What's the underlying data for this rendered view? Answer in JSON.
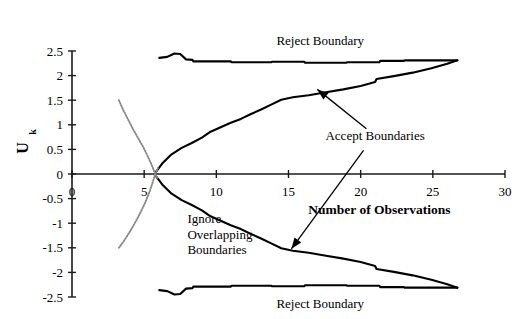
{
  "chart_data": {
    "type": "line",
    "title": "",
    "xlabel": "Number of Observations",
    "ylabel": "U",
    "ylabel_subscript": "k",
    "xlim": [
      0,
      30
    ],
    "ylim": [
      -2.5,
      2.5
    ],
    "xticks": [
      0,
      5,
      10,
      15,
      20,
      25,
      30
    ],
    "xtick_labels": [
      "0",
      "5",
      "10",
      "15",
      "20",
      "25",
      "30"
    ],
    "yticks": [
      -2.5,
      -2,
      -1.5,
      -1,
      -0.5,
      0,
      0.5,
      1,
      1.5,
      2,
      2.5
    ],
    "ytick_labels": [
      "-2.5",
      "-2",
      "-1.5",
      "-1",
      "-0.5",
      "0",
      "0.5",
      "1",
      "1.5",
      "2",
      "2.5"
    ],
    "grid": false,
    "legend_position": "none",
    "line_color": "#000000",
    "dotted_color": "#8a8a8a",
    "axis_color": "#1a1a1a",
    "series": [
      {
        "name": "Upper Reject Boundary",
        "style": "solid-step",
        "points": [
          [
            6.05,
            2.36
          ],
          [
            6.6,
            2.38
          ],
          [
            7.1,
            2.45
          ],
          [
            7.5,
            2.44
          ],
          [
            7.9,
            2.33
          ],
          [
            8.35,
            2.32
          ],
          [
            8.4,
            2.29
          ],
          [
            11.0,
            2.29
          ],
          [
            11.05,
            2.27
          ],
          [
            13.8,
            2.27
          ],
          [
            13.85,
            2.28
          ],
          [
            16.1,
            2.28
          ],
          [
            16.15,
            2.26
          ],
          [
            19.0,
            2.26
          ],
          [
            19.05,
            2.27
          ],
          [
            21.3,
            2.27
          ],
          [
            21.35,
            2.3
          ],
          [
            23.0,
            2.3
          ],
          [
            23.05,
            2.31
          ],
          [
            26.7,
            2.31
          ]
        ]
      },
      {
        "name": "Upper Accept Boundary",
        "style": "solid",
        "points": [
          [
            5.75,
            0.02
          ],
          [
            6.3,
            0.23
          ],
          [
            6.9,
            0.4
          ],
          [
            7.6,
            0.53
          ],
          [
            8.3,
            0.63
          ],
          [
            9.0,
            0.74
          ],
          [
            9.6,
            0.86
          ],
          [
            10.3,
            0.95
          ],
          [
            11.0,
            1.04
          ],
          [
            11.7,
            1.12
          ],
          [
            12.4,
            1.22
          ],
          [
            13.1,
            1.31
          ],
          [
            13.8,
            1.41
          ],
          [
            14.5,
            1.51
          ],
          [
            15.3,
            1.56
          ],
          [
            16.4,
            1.6
          ],
          [
            17.6,
            1.66
          ],
          [
            18.8,
            1.72
          ],
          [
            20.0,
            1.79
          ],
          [
            21.0,
            1.87
          ],
          [
            21.1,
            1.93
          ],
          [
            22.3,
            1.99
          ],
          [
            23.6,
            2.06
          ],
          [
            24.9,
            2.15
          ],
          [
            26.0,
            2.24
          ],
          [
            26.7,
            2.31
          ]
        ]
      },
      {
        "name": "Lower Accept Boundary",
        "style": "solid",
        "points": [
          [
            5.75,
            -0.02
          ],
          [
            6.3,
            -0.23
          ],
          [
            6.9,
            -0.4
          ],
          [
            7.6,
            -0.53
          ],
          [
            8.3,
            -0.63
          ],
          [
            9.0,
            -0.74
          ],
          [
            9.6,
            -0.86
          ],
          [
            10.3,
            -0.95
          ],
          [
            11.0,
            -1.04
          ],
          [
            11.7,
            -1.12
          ],
          [
            12.4,
            -1.22
          ],
          [
            13.1,
            -1.31
          ],
          [
            13.8,
            -1.41
          ],
          [
            14.5,
            -1.51
          ],
          [
            15.3,
            -1.56
          ],
          [
            16.4,
            -1.6
          ],
          [
            17.6,
            -1.66
          ],
          [
            18.8,
            -1.72
          ],
          [
            20.0,
            -1.79
          ],
          [
            21.0,
            -1.87
          ],
          [
            21.1,
            -1.93
          ],
          [
            22.3,
            -1.99
          ],
          [
            23.6,
            -2.06
          ],
          [
            24.9,
            -2.15
          ],
          [
            26.0,
            -2.24
          ],
          [
            26.7,
            -2.31
          ]
        ]
      },
      {
        "name": "Lower Reject Boundary",
        "style": "solid-step",
        "points": [
          [
            6.05,
            -2.36
          ],
          [
            6.6,
            -2.38
          ],
          [
            7.1,
            -2.45
          ],
          [
            7.5,
            -2.44
          ],
          [
            7.9,
            -2.33
          ],
          [
            8.35,
            -2.32
          ],
          [
            8.4,
            -2.29
          ],
          [
            11.0,
            -2.29
          ],
          [
            11.05,
            -2.27
          ],
          [
            13.8,
            -2.27
          ],
          [
            13.85,
            -2.28
          ],
          [
            16.1,
            -2.28
          ],
          [
            16.15,
            -2.26
          ],
          [
            19.0,
            -2.26
          ],
          [
            19.05,
            -2.27
          ],
          [
            21.3,
            -2.27
          ],
          [
            21.35,
            -2.3
          ],
          [
            23.0,
            -2.3
          ],
          [
            23.05,
            -2.31
          ],
          [
            26.7,
            -2.31
          ]
        ]
      },
      {
        "name": "Ignore Overlapping Boundary Upper",
        "style": "dotted",
        "points": [
          [
            3.25,
            1.5
          ],
          [
            3.55,
            1.3
          ],
          [
            3.9,
            1.1
          ],
          [
            4.25,
            0.9
          ],
          [
            4.6,
            0.72
          ],
          [
            4.95,
            0.54
          ],
          [
            5.25,
            0.36
          ],
          [
            5.5,
            0.2
          ],
          [
            5.7,
            0.05
          ],
          [
            5.9,
            -0.08
          ]
        ]
      },
      {
        "name": "Ignore Overlapping Boundary Lower",
        "style": "dotted",
        "points": [
          [
            3.25,
            -1.5
          ],
          [
            3.55,
            -1.38
          ],
          [
            3.95,
            -1.2
          ],
          [
            4.35,
            -1.0
          ],
          [
            4.75,
            -0.78
          ],
          [
            5.1,
            -0.56
          ],
          [
            5.4,
            -0.34
          ],
          [
            5.6,
            -0.16
          ],
          [
            5.75,
            -0.01
          ],
          [
            5.95,
            0.12
          ]
        ]
      }
    ],
    "annotations": [
      {
        "id": "reject-boundary-top",
        "text": "Reject Boundary",
        "x": 17.2,
        "y": 2.62
      },
      {
        "id": "reject-boundary-bottom",
        "text": "Reject Boundary",
        "x": 17.2,
        "y": -2.72
      },
      {
        "id": "accept-boundaries",
        "text": "Accept Boundaries",
        "x": 21.0,
        "y": 0.7
      },
      {
        "id": "ignore-overlapping-boundaries",
        "lines": [
          "Ignore",
          "Overlapping",
          "Boundaries"
        ],
        "x": 8.0,
        "y": -1.0
      }
    ],
    "arrows": [
      {
        "id": "arrow-to-upper-accept",
        "from": [
          20.4,
          0.92
        ],
        "to": [
          17.0,
          1.72
        ]
      },
      {
        "id": "arrow-to-lower-accept",
        "from": [
          20.2,
          0.48
        ],
        "to": [
          15.2,
          -1.52
        ]
      }
    ]
  }
}
